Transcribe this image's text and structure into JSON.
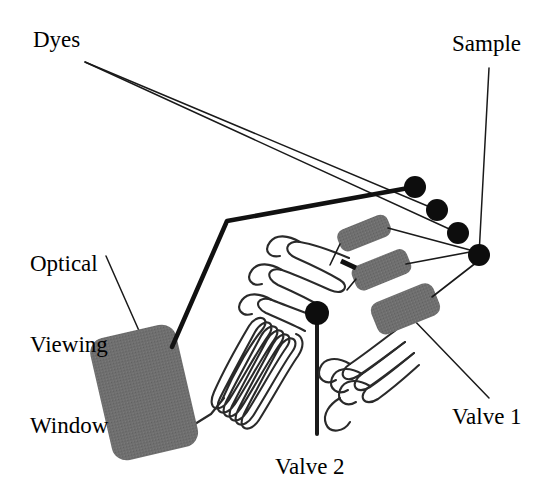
{
  "diagram": {
    "background_color": "#ffffff",
    "stroke_color": "#1a1a1a",
    "component_fill": "#6f6f6f",
    "labels": [
      {
        "id": "dyes",
        "text": "Dyes",
        "x": 33,
        "y": 26,
        "align": "left"
      },
      {
        "id": "sample",
        "text": "Sample",
        "x": 452,
        "y": 30,
        "align": "left"
      },
      {
        "id": "window",
        "line1": "Optical",
        "line2": "Viewing",
        "line3": "Window",
        "x": 30,
        "y": 198,
        "align": "left"
      },
      {
        "id": "valve1",
        "text": "Valve 1",
        "x": 452,
        "y": 405,
        "align": "left"
      },
      {
        "id": "valve2",
        "text": "Valve 2",
        "x": 275,
        "y": 455,
        "align": "left"
      }
    ],
    "ports": [
      {
        "id": "port-1",
        "name": "dye-port-a",
        "cx": 415,
        "cy": 187,
        "r": 11
      },
      {
        "id": "port-2",
        "name": "dye-port-b",
        "cx": 437,
        "cy": 210,
        "r": 11
      },
      {
        "id": "port-3",
        "name": "dye-port-c",
        "cx": 458,
        "cy": 233,
        "r": 11
      },
      {
        "id": "port-4",
        "name": "sample-port",
        "cx": 479,
        "cy": 255,
        "r": 11
      }
    ],
    "valve_junction": {
      "id": "valve-2-node",
      "cx": 317,
      "cy": 314,
      "r": 12
    },
    "optical_window": {
      "x": 100,
      "y": 330,
      "width": 88,
      "height": 125,
      "rx": 14,
      "rotate": -13,
      "fill": "#6f6f6f"
    },
    "valve_bars": [
      {
        "id": "valve-bar-1",
        "x": 337,
        "y": 222,
        "width": 52,
        "height": 22,
        "rx": 7,
        "rotate": -22
      },
      {
        "id": "valve-bar-2",
        "x": 352,
        "y": 257,
        "width": 58,
        "height": 25,
        "rx": 7,
        "rotate": -22
      },
      {
        "id": "valve-bar-3",
        "x": 372,
        "y": 292,
        "width": 66,
        "height": 33,
        "rx": 8,
        "rotate": -22
      }
    ],
    "tick_mark": {
      "id": "stop-tick",
      "x1": 342,
      "y1": 262,
      "x2": 356,
      "y2": 268
    },
    "leader_lines": [
      {
        "id": "dyes-leader-a",
        "points": "85,62 437,210"
      },
      {
        "id": "dyes-leader-b",
        "points": "85,62 458,233"
      },
      {
        "id": "sample-leader",
        "points": "489,68 479,255"
      },
      {
        "id": "window-leader",
        "points": "108,258 138,330"
      },
      {
        "id": "valve1-leader",
        "points": "412,318 487,398"
      },
      {
        "id": "valve2-leader",
        "points": "317,314 317,432"
      }
    ],
    "channels": {
      "thick_path": "172,345 227,222 415,187",
      "window_outlet": "156,452 214,412 222,400",
      "lower_coil_turns": 7,
      "upper_coil_turns": 4,
      "right_coil_turns": 6
    },
    "colors": {
      "ink": "#1a1a1a",
      "component_gray": "#6f6f6f",
      "paper": "#ffffff"
    }
  }
}
